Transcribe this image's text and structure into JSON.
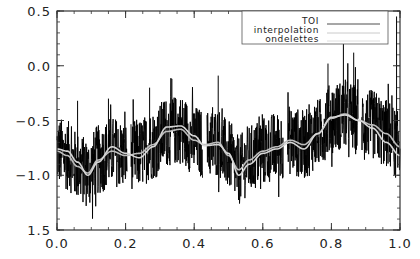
{
  "chart_data": {
    "type": "line",
    "title": "",
    "xlabel": "",
    "ylabel": "",
    "xlim": [
      0.0,
      1.0
    ],
    "ylim": [
      -1.5,
      0.5
    ],
    "grid": false,
    "legend_position": "upper-right (inside)",
    "x_ticks": [
      {
        "value": 0.0,
        "label": "0.0"
      },
      {
        "value": 0.2,
        "label": "0.2"
      },
      {
        "value": 0.4,
        "label": "0.4"
      },
      {
        "value": 0.6,
        "label": "0.6"
      },
      {
        "value": 0.8,
        "label": "0.8"
      },
      {
        "value": 1.0,
        "label": "1.0"
      }
    ],
    "y_ticks": [
      {
        "value": 0.5,
        "label": "0.5"
      },
      {
        "value": 0.0,
        "label": "0.0"
      },
      {
        "value": -0.5,
        "label": "-0.5"
      },
      {
        "value": -1.0,
        "label": "-1.0"
      },
      {
        "value": -1.5,
        "label": "1.5"
      }
    ],
    "data_gaps": [
      [
        0.205,
        0.215
      ],
      [
        0.425,
        0.437
      ],
      [
        0.66,
        0.672
      ],
      [
        0.878,
        0.888
      ]
    ],
    "series": [
      {
        "name": "TOI",
        "style": "noisy signal, black",
        "color": "#000000",
        "noise_amplitude": 0.32,
        "mean_follows": "interpolation",
        "spikes": [
          {
            "x": 0.06,
            "y": -0.32
          },
          {
            "x": 0.15,
            "y": -0.3
          },
          {
            "x": 0.27,
            "y": -0.2
          },
          {
            "x": 0.335,
            "y": -0.12
          },
          {
            "x": 0.47,
            "y": -0.09
          },
          {
            "x": 0.79,
            "y": 0.02
          },
          {
            "x": 0.835,
            "y": 0.28
          },
          {
            "x": 0.865,
            "y": 0.12
          },
          {
            "x": 0.99,
            "y": 0.45
          }
        ]
      },
      {
        "name": "interpolation",
        "style": "smooth curve, light gray",
        "color": "#bdbdbd",
        "x": [
          0.0,
          0.03,
          0.06,
          0.09,
          0.12,
          0.16,
          0.2,
          0.24,
          0.28,
          0.32,
          0.36,
          0.4,
          0.43,
          0.47,
          0.5,
          0.53,
          0.56,
          0.6,
          0.64,
          0.68,
          0.72,
          0.76,
          0.8,
          0.84,
          0.88,
          0.92,
          0.96,
          1.0
        ],
        "y": [
          -0.78,
          -0.82,
          -0.92,
          -0.98,
          -0.86,
          -0.78,
          -0.82,
          -0.8,
          -0.72,
          -0.6,
          -0.58,
          -0.68,
          -0.72,
          -0.7,
          -0.82,
          -0.95,
          -0.86,
          -0.78,
          -0.74,
          -0.68,
          -0.72,
          -0.62,
          -0.48,
          -0.44,
          -0.5,
          -0.54,
          -0.62,
          -0.74
        ]
      },
      {
        "name": "ondelettes",
        "style": "smooth curve, light gray",
        "color": "#d6d6d6",
        "x": [
          0.0,
          0.03,
          0.06,
          0.09,
          0.12,
          0.16,
          0.2,
          0.24,
          0.28,
          0.32,
          0.36,
          0.4,
          0.43,
          0.47,
          0.5,
          0.53,
          0.56,
          0.6,
          0.64,
          0.68,
          0.72,
          0.76,
          0.8,
          0.84,
          0.88,
          0.92,
          0.96,
          1.0
        ],
        "y": [
          -0.76,
          -0.78,
          -0.88,
          -1.0,
          -0.88,
          -0.74,
          -0.8,
          -0.84,
          -0.74,
          -0.56,
          -0.55,
          -0.64,
          -0.73,
          -0.72,
          -0.8,
          -1.0,
          -0.9,
          -0.8,
          -0.76,
          -0.7,
          -0.76,
          -0.62,
          -0.47,
          -0.45,
          -0.5,
          -0.57,
          -0.7,
          -0.82
        ]
      }
    ]
  },
  "legend": {
    "items": [
      {
        "label": "TOI",
        "color": "#000000"
      },
      {
        "label": "interpolation",
        "color": "#bdbdbd"
      },
      {
        "label": "ondelettes",
        "color": "#d6d6d6"
      }
    ]
  }
}
